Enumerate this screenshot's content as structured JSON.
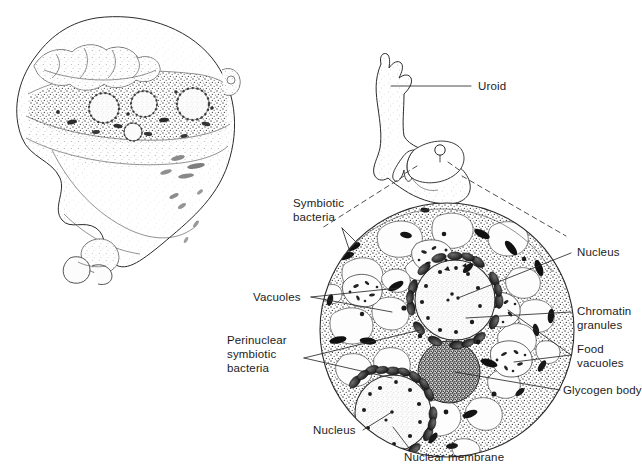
{
  "figure": {
    "background_color": "#ffffff",
    "ink_color": "#1c1c1c"
  },
  "panels": {
    "left_panel": {
      "name": "stippled-amoeba-drawing",
      "description": "Pen-and-ink stippled drawing of an engorged amoeba with a cutaway section revealing nuclei and granular cytoplasm"
    },
    "top_right_panel": {
      "name": "amoeba-schematic",
      "description": "Outline schematic of amoeba with uroid projections and a wedge cutaway marked for magnification"
    },
    "bottom_right_panel": {
      "name": "magnified-cytoplasm-circle",
      "description": "Circular magnified view of cytoplasm showing vacuoles, nuclei, symbiotic bacteria and glycogen body"
    }
  },
  "labels": {
    "uroid": "Uroid",
    "symbiotic_bacteria": "Symbiotic\nbacteria",
    "symbiotic_bacteria_l1": "Symbiotic",
    "symbiotic_bacteria_l2": "bacteria",
    "vacuoles": "Vacuoles",
    "perinuclear_l1": "Perinuclear",
    "perinuclear_l2": "symbiotic",
    "perinuclear_l3": "bacteria",
    "nucleus_right": "Nucleus",
    "chromatin_l1": "Chromatin",
    "chromatin_l2": "granules",
    "food_vacuoles_l1": "Food",
    "food_vacuoles_l2": "vacuoles",
    "glycogen_body": "Glycogen body",
    "nucleus_bottom": "Nucleus",
    "nuclear_membrane": "Nuclear membrane"
  },
  "structures": {
    "cell_circle": {
      "cx": 447,
      "cy": 330,
      "r": 128
    },
    "upper_nucleus": {
      "cx": 455,
      "cy": 300,
      "r": 40
    },
    "lower_nucleus": {
      "cx": 393,
      "cy": 413,
      "r": 38
    },
    "glycogen_body": {
      "cx": 449,
      "cy": 372,
      "r": 31
    },
    "counts": {
      "vacuoles": 18,
      "food_vacuoles": 5,
      "symbiotic_bacteria_rods": 22,
      "perinuclear_bacteria_upper": 17,
      "perinuclear_bacteria_lower": 14,
      "nuclei": 2
    }
  }
}
